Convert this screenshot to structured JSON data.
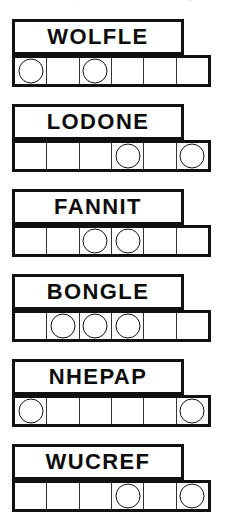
{
  "page": {
    "header_ghost_text": "a word puzzle worksheet fragment",
    "ink_color": "#111111",
    "background_color": "#ffffff",
    "cells_per_row": 6
  },
  "puzzles": [
    {
      "word": "WOLFLE",
      "cells": [
        {
          "index": 1,
          "circled": true
        },
        {
          "index": 2,
          "circled": false
        },
        {
          "index": 3,
          "circled": true
        },
        {
          "index": 4,
          "circled": false
        },
        {
          "index": 5,
          "circled": false
        },
        {
          "index": 6,
          "circled": false
        }
      ]
    },
    {
      "word": "LODONE",
      "cells": [
        {
          "index": 1,
          "circled": false
        },
        {
          "index": 2,
          "circled": false
        },
        {
          "index": 3,
          "circled": false
        },
        {
          "index": 4,
          "circled": true
        },
        {
          "index": 5,
          "circled": false
        },
        {
          "index": 6,
          "circled": true
        }
      ]
    },
    {
      "word": "FANNIT",
      "cells": [
        {
          "index": 1,
          "circled": false
        },
        {
          "index": 2,
          "circled": false
        },
        {
          "index": 3,
          "circled": true
        },
        {
          "index": 4,
          "circled": true
        },
        {
          "index": 5,
          "circled": false
        },
        {
          "index": 6,
          "circled": false
        }
      ]
    },
    {
      "word": "BONGLE",
      "cells": [
        {
          "index": 1,
          "circled": false
        },
        {
          "index": 2,
          "circled": true
        },
        {
          "index": 3,
          "circled": true
        },
        {
          "index": 4,
          "circled": true
        },
        {
          "index": 5,
          "circled": false
        },
        {
          "index": 6,
          "circled": false
        }
      ]
    },
    {
      "word": "NHEPAP",
      "cells": [
        {
          "index": 1,
          "circled": true
        },
        {
          "index": 2,
          "circled": false
        },
        {
          "index": 3,
          "circled": false
        },
        {
          "index": 4,
          "circled": false
        },
        {
          "index": 5,
          "circled": false
        },
        {
          "index": 6,
          "circled": true
        }
      ]
    },
    {
      "word": "WUCREF",
      "cells": [
        {
          "index": 1,
          "circled": false
        },
        {
          "index": 2,
          "circled": false
        },
        {
          "index": 3,
          "circled": false
        },
        {
          "index": 4,
          "circled": true
        },
        {
          "index": 5,
          "circled": false
        },
        {
          "index": 6,
          "circled": true
        }
      ]
    }
  ]
}
